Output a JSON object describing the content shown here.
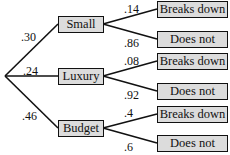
{
  "diagram": {
    "type": "probability-tree",
    "root": "",
    "branches": [
      {
        "label": "Small",
        "prob": ".30",
        "children": [
          {
            "label": "Breaks down",
            "prob": ".14"
          },
          {
            "label": "Does not",
            "prob": ".86"
          }
        ]
      },
      {
        "label": "Luxury",
        "prob": ".24",
        "children": [
          {
            "label": "Breaks down",
            "prob": ".08"
          },
          {
            "label": "Does not",
            "prob": ".92"
          }
        ]
      },
      {
        "label": "Budget",
        "prob": ".46",
        "children": [
          {
            "label": "Breaks down",
            "prob": ".4"
          },
          {
            "label": "Does not",
            "prob": ".6"
          }
        ]
      }
    ]
  },
  "colors": {
    "box_fill": "#dcdcdc",
    "line": "#111111"
  }
}
